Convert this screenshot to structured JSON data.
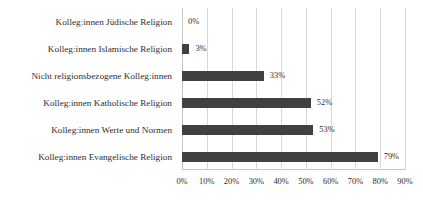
{
  "chart_data": {
    "type": "bar",
    "orientation": "horizontal",
    "title": "",
    "subtitle": "",
    "xlabel": "",
    "ylabel": "",
    "grid": true,
    "legend": "none",
    "xlim": [
      0,
      90
    ],
    "xtick_labels": [
      "0%",
      "10%",
      "20%",
      "30%",
      "40%",
      "50%",
      "60%",
      "70%",
      "80%",
      "90%"
    ],
    "xtick_values": [
      0,
      10,
      20,
      30,
      40,
      50,
      60,
      70,
      80,
      90
    ],
    "categories": [
      "Kolleg:innen Jüdische Religion",
      "Kolleg:innen Islamische Religion",
      "Nicht religionsbezogene Kolleg:innen",
      "Kolleg:innen Katholische Religion",
      "Kolleg:innen Werte und Normen",
      "Kolleg:innen Evangelische Religion"
    ],
    "values": [
      0,
      3,
      33,
      52,
      53,
      79
    ],
    "value_labels": [
      "0%",
      "3%",
      "33%",
      "52%",
      "53%",
      "79%"
    ],
    "bar_color": "#404040",
    "grid_color": "#d6d6d6",
    "text_color": "#2e2e2e",
    "background_color": "#ffffff"
  }
}
